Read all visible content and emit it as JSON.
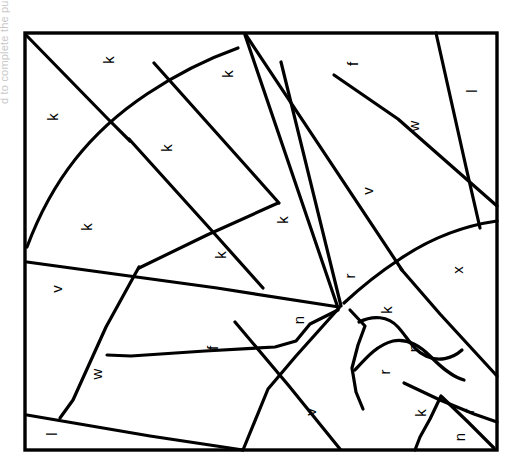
{
  "page": {
    "background_color": "#ffffff",
    "line_color": "#000000",
    "width": 521,
    "height": 473
  },
  "margin_note": {
    "text": "d to complete the puzzle",
    "color": "#c9c9c9",
    "orientation": "vertical-left-clipped"
  },
  "frame": {
    "x": 25,
    "y": 33,
    "width": 472,
    "height": 417,
    "stroke": "#000000"
  },
  "labels": [
    {
      "id": "label-1",
      "letter": "k",
      "x": 110,
      "y": 60
    },
    {
      "id": "label-2",
      "letter": "k",
      "x": 54,
      "y": 117
    },
    {
      "id": "label-3",
      "letter": "k",
      "x": 229,
      "y": 74
    },
    {
      "id": "label-4",
      "letter": "k",
      "x": 168,
      "y": 148
    },
    {
      "id": "label-5",
      "letter": "k",
      "x": 88,
      "y": 227
    },
    {
      "id": "label-6",
      "letter": "k",
      "x": 222,
      "y": 255
    },
    {
      "id": "label-7",
      "letter": "k",
      "x": 284,
      "y": 220
    },
    {
      "id": "label-8",
      "letter": "f",
      "x": 354,
      "y": 64
    },
    {
      "id": "label-9",
      "letter": "l",
      "x": 473,
      "y": 91
    },
    {
      "id": "label-10",
      "letter": "w",
      "x": 415,
      "y": 126
    },
    {
      "id": "label-11",
      "letter": "v",
      "x": 369,
      "y": 191
    },
    {
      "id": "label-12",
      "letter": "v",
      "x": 58,
      "y": 289
    },
    {
      "id": "label-13",
      "letter": "f",
      "x": 214,
      "y": 348
    },
    {
      "id": "label-14",
      "letter": "w",
      "x": 98,
      "y": 374
    },
    {
      "id": "label-15",
      "letter": "l",
      "x": 53,
      "y": 434
    },
    {
      "id": "label-16",
      "letter": "v",
      "x": 312,
      "y": 412
    },
    {
      "id": "label-17",
      "letter": "n",
      "x": 300,
      "y": 320
    },
    {
      "id": "label-18",
      "letter": "r",
      "x": 351,
      "y": 276
    },
    {
      "id": "label-19",
      "letter": "k",
      "x": 388,
      "y": 310
    },
    {
      "id": "label-20",
      "letter": "x",
      "x": 459,
      "y": 270
    },
    {
      "id": "label-21",
      "letter": "n",
      "x": 415,
      "y": 348
    },
    {
      "id": "label-22",
      "letter": "r",
      "x": 386,
      "y": 372
    },
    {
      "id": "label-23",
      "letter": "k",
      "x": 422,
      "y": 413
    },
    {
      "id": "label-24",
      "letter": "r",
      "x": 470,
      "y": 411
    },
    {
      "id": "label-25",
      "letter": "n",
      "x": 461,
      "y": 437
    }
  ],
  "cut_lines": [
    {
      "id": "cut-1",
      "d": "M 26 35 L 108 119 L 130 141"
    },
    {
      "id": "cut-2",
      "d": "M 27 247 C 52 180 90 132 147 94 C 180 72 210 58 238 48"
    },
    {
      "id": "cut-3",
      "d": "M 129 139 L 213 232 L 263 288"
    },
    {
      "id": "cut-4",
      "d": "M 154 63 L 247 167 L 279 203"
    },
    {
      "id": "cut-5",
      "d": "M 278 203 L 207 235 L 139 268"
    },
    {
      "id": "cut-6",
      "d": "M 245 35 L 338 308"
    },
    {
      "id": "cut-7",
      "d": "M 246 35 L 402 270"
    },
    {
      "id": "cut-8",
      "d": "M 281 62 L 341 306"
    },
    {
      "id": "cut-9",
      "d": "M 339 307 L 217 288 L 27 262"
    },
    {
      "id": "cut-10",
      "d": "M 339 308 L 296 356 L 268 389 L 243 450"
    },
    {
      "id": "cut-11",
      "d": "M 139 267 L 106 327 L 73 400 L 60 418"
    },
    {
      "id": "cut-12",
      "d": "M 27 415 L 150 436 L 243 450"
    },
    {
      "id": "cut-13",
      "d": "M 235 322 L 289 386 L 340 449"
    },
    {
      "id": "cut-14",
      "d": "M 338 310 L 310 324 L 296 341 L 275 347 L 205 351 L 131 356 L 107 355"
    },
    {
      "id": "cut-15",
      "d": "M 334 75 L 398 119 L 497 206"
    },
    {
      "id": "cut-16",
      "d": "M 436 33 L 466 167 L 480 228"
    },
    {
      "id": "cut-17",
      "d": "M 497 221 C 462 226 428 240 400 259 C 377 274 358 290 344 303"
    },
    {
      "id": "cut-18",
      "d": "M 401 269 L 440 314 L 497 376"
    },
    {
      "id": "cut-19",
      "d": "M 359 322 C 373 315 388 316 398 327 C 408 338 413 350 426 356 C 438 362 452 359 462 350"
    },
    {
      "id": "cut-20",
      "d": "M 355 370 C 366 358 377 345 393 341 C 408 338 420 346 430 356 C 441 367 452 377 464 380"
    },
    {
      "id": "cut-21",
      "d": "M 350 310 L 365 326 L 358 345 L 352 368 L 356 392 L 363 409"
    },
    {
      "id": "cut-22",
      "d": "M 404 383 L 440 400 L 474 414 L 497 422"
    },
    {
      "id": "cut-23",
      "d": "M 441 396 L 430 419 L 420 437 L 415 450"
    },
    {
      "id": "cut-24",
      "d": "M 442 397 L 468 422 L 494 448"
    }
  ]
}
